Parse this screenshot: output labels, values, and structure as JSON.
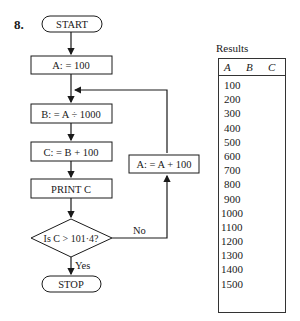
{
  "problem_number": "8.",
  "flowchart": {
    "start": "START",
    "step_init": "A: = 100",
    "step_b": "B: = A ÷ 1000",
    "step_c": "C: = B + 100",
    "step_print": "PRINT C",
    "decision": "Is C > 101·4?",
    "branch_no": "No",
    "branch_yes": "Yes",
    "step_increment": "A: = A + 100",
    "stop": "STOP"
  },
  "results": {
    "title": "Results",
    "columns": [
      "A",
      "B",
      "C"
    ],
    "rows": [
      {
        "A": "100"
      },
      {
        "A": "200"
      },
      {
        "A": "300"
      },
      {
        "A": "400"
      },
      {
        "A": "500"
      },
      {
        "A": "600"
      },
      {
        "A": "700"
      },
      {
        "A": "800"
      },
      {
        "A": "900"
      },
      {
        "A": "1000"
      },
      {
        "A": "1100"
      },
      {
        "A": "1200"
      },
      {
        "A": "1300"
      },
      {
        "A": "1400"
      },
      {
        "A": "1500"
      }
    ]
  }
}
